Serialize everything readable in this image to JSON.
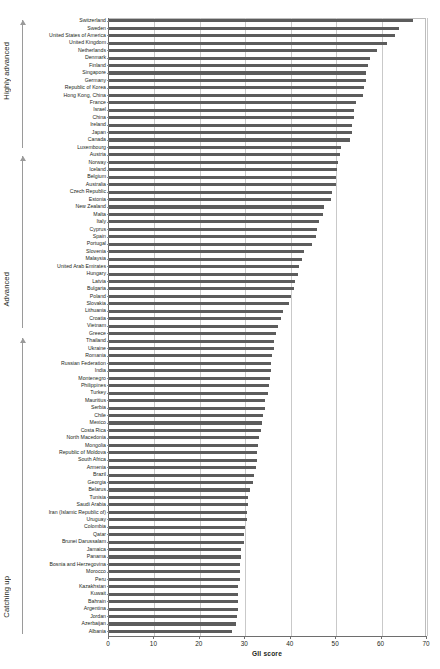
{
  "chart_data": {
    "type": "bar",
    "orientation": "horizontal",
    "title": "",
    "xlabel": "GII score",
    "ylabel": "",
    "xlim": [
      0,
      70
    ],
    "xticks": [
      0,
      10,
      20,
      30,
      40,
      50,
      60,
      70
    ],
    "grid": true,
    "legend_position": "none",
    "bar_color": "#5c5c5c",
    "categories": [
      "Switzerland",
      "Sweden",
      "United States of America",
      "United Kingdom",
      "Netherlands",
      "Denmark",
      "Finland",
      "Singapore",
      "Germany",
      "Republic of Korea",
      "Hong Kong, China",
      "France",
      "Israel",
      "China",
      "Ireland",
      "Japan",
      "Canada",
      "Luxembourg",
      "Austria",
      "Norway",
      "Iceland",
      "Belgium",
      "Australia",
      "Czech Republic",
      "Estonia",
      "New Zealand",
      "Malta",
      "Italy",
      "Cyprus",
      "Spain",
      "Portugal",
      "Slovenia",
      "Malaysia",
      "United Arab Emirates",
      "Hungary",
      "Latvia",
      "Bulgaria",
      "Poland",
      "Slovakia",
      "Lithuania",
      "Croatia",
      "Vietnam",
      "Greece",
      "Thailand",
      "Ukraine",
      "Romania",
      "Russian Federation",
      "India",
      "Montenegro",
      "Philippines",
      "Turkey",
      "Mauritius",
      "Serbia",
      "Chile",
      "Mexico",
      "Costa Rica",
      "North Macedonia",
      "Mongolia",
      "Republic of Moldova",
      "South Africa",
      "Armenia",
      "Brazil",
      "Georgia",
      "Belarus",
      "Tunisia",
      "Saudi Arabia",
      "Iran (Islamic Republic of)",
      "Uruguay",
      "Colombia",
      "Qatar",
      "Brunei Darussalam",
      "Jamaica",
      "Panama",
      "Bosnia and Herzegovina",
      "Morocco",
      "Peru",
      "Kazakhstan",
      "Kuwait",
      "Bahrain",
      "Argentina",
      "Jordan",
      "Azerbaijan",
      "Albania"
    ],
    "values": [
      67.0,
      63.8,
      63.0,
      61.3,
      59.0,
      57.5,
      57.0,
      56.6,
      56.5,
      56.1,
      56.0,
      54.3,
      53.9,
      53.9,
      53.6,
      53.5,
      53.0,
      51.0,
      50.9,
      50.3,
      50.2,
      50.0,
      49.9,
      49.0,
      48.9,
      47.4,
      47.0,
      46.3,
      45.7,
      45.6,
      44.6,
      42.9,
      42.4,
      41.8,
      41.5,
      41.0,
      40.7,
      40.0,
      39.7,
      38.4,
      37.8,
      37.1,
      36.8,
      36.3,
      36.3,
      35.9,
      35.6,
      35.6,
      35.4,
      35.2,
      34.9,
      34.4,
      34.3,
      33.8,
      33.6,
      33.5,
      33.0,
      32.9,
      32.6,
      32.5,
      32.3,
      31.9,
      31.8,
      31.0,
      30.7,
      30.5,
      30.4,
      30.3,
      30.0,
      29.8,
      29.8,
      29.1,
      29.0,
      28.8,
      28.8,
      28.8,
      28.5,
      28.4,
      28.4,
      28.3,
      28.2,
      28.0,
      27.1
    ]
  },
  "groups": [
    {
      "label": "Highly advanced",
      "arrow": "up-arrow"
    },
    {
      "label": "Advanced",
      "arrow": "up-arrow"
    },
    {
      "label": "Catching up",
      "arrow": "up-arrow"
    }
  ]
}
